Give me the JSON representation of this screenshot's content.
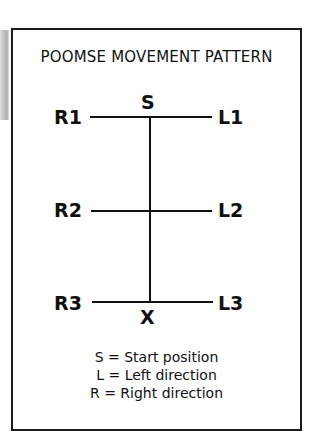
{
  "diagram": {
    "title": "POOMSE MOVEMENT PATTERN",
    "start_label": "S",
    "end_label": "X",
    "rows": [
      {
        "right": "R1",
        "left": "L1"
      },
      {
        "right": "R2",
        "left": "L2"
      },
      {
        "right": "R3",
        "left": "L3"
      }
    ],
    "legend": [
      "S = Start position",
      "L = Left direction",
      "R = Right direction"
    ]
  }
}
